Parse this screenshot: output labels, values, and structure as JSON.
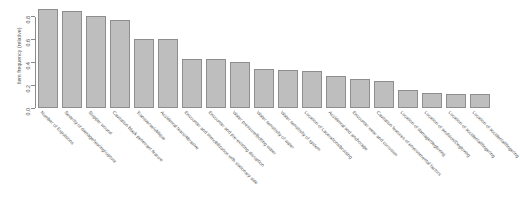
{
  "chart_data": {
    "type": "bar",
    "title": "",
    "subtitle": "",
    "xlabel": "",
    "ylabel": "Item frequency (relative)",
    "ylim": [
      0,
      0.9
    ],
    "grid": false,
    "legend": null,
    "yticks": [
      {
        "value": 0.0,
        "label": "0.0"
      },
      {
        "value": 0.2,
        "label": "0.2"
      },
      {
        "value": 0.4,
        "label": "0.4"
      },
      {
        "value": 0.6,
        "label": "0.6"
      },
      {
        "value": 0.8,
        "label": "0.8"
      }
    ],
    "bar_color": "#bebebe",
    "bar_border_color": "#8e8e8e",
    "categories": [
      "Number of Expulsions",
      "Severity of damage/tearing/rupture",
      "Stopper wound",
      "Cavitation black penetrant feature",
      "Transverse/oblique",
      "Accidental tears/Abrasive",
      "Encounter and immobilization with stationary side",
      "Encounter and pre-existing disruption",
      "Water pressure/Bolting water",
      "Water sensitivity of water",
      "Water sensitivity of system",
      "Location of Lacerations/bruising",
      "Accidental and anchorage",
      "Encounter wear and corrosion",
      "Cavitation features of environmental factors",
      "Location of damage/degloving",
      "Location of avulsion/Degloving",
      "Location of accidental/fingering",
      "Location of accidental/fingering"
    ],
    "values": [
      0.86,
      0.84,
      0.8,
      0.76,
      0.6,
      0.6,
      0.42,
      0.42,
      0.4,
      0.34,
      0.33,
      0.32,
      0.28,
      0.25,
      0.23,
      0.16,
      0.13,
      0.12,
      0.12
    ]
  }
}
